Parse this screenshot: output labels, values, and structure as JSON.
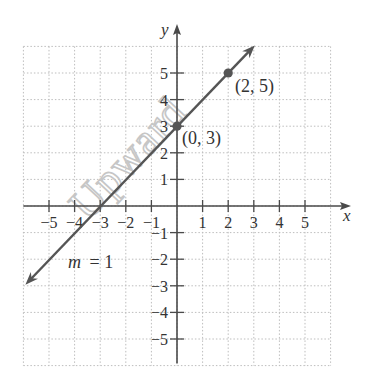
{
  "chart_data": {
    "type": "line",
    "title": "",
    "xlabel": "x",
    "ylabel": "y",
    "xlim": [
      -6,
      6
    ],
    "ylim": [
      -6,
      6
    ],
    "grid": true,
    "x_ticks": [
      -5,
      -4,
      -3,
      -2,
      -1,
      1,
      2,
      3,
      4,
      5
    ],
    "y_ticks": [
      -5,
      -4,
      -3,
      -2,
      -1,
      1,
      2,
      3,
      4,
      5
    ],
    "x_tick_labels": [
      "−5",
      "−4",
      "−3",
      "−2",
      "−1",
      "1",
      "2",
      "3",
      "4",
      "5"
    ],
    "y_tick_labels": [
      "−5",
      "−4",
      "−3",
      "−2",
      "−1",
      "1",
      "2",
      "3",
      "4",
      "5"
    ],
    "series": [
      {
        "name": "y = x + 3",
        "slope": 1,
        "intercept": 3,
        "x": [
          -6,
          3
        ],
        "y": [
          -3,
          6
        ],
        "arrows_both_ends": true
      }
    ],
    "points": [
      {
        "x": 0,
        "y": 3,
        "label": "(0, 3)"
      },
      {
        "x": 2,
        "y": 5,
        "label": "(2, 5)"
      }
    ],
    "annotations": [
      {
        "text": "m = 1",
        "x": -4.3,
        "y": -2.3
      }
    ],
    "watermark": "Upward"
  },
  "labels": {
    "x_axis": "x",
    "y_axis": "y",
    "point_a": "(0, 3)",
    "point_b": "(2, 5)",
    "slope_m": "m",
    "slope_eq": "= 1",
    "watermark": "Upward"
  },
  "colors": {
    "axis": "#4a4a4a",
    "line": "#555555",
    "grid": "#bdbdbd",
    "text": "#333333",
    "watermark": "#c8c8c8"
  }
}
